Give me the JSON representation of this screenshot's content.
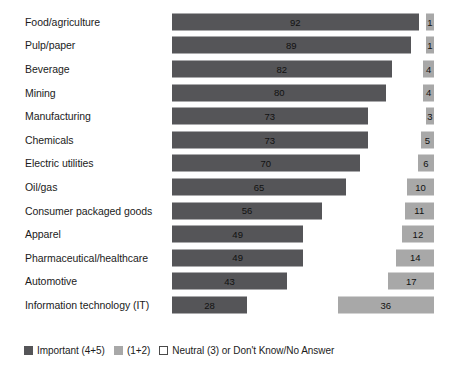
{
  "chart_data": {
    "type": "bar",
    "orientation": "horizontal",
    "stacked": true,
    "title": "",
    "subtitle": "",
    "xlabel": "",
    "ylabel": "",
    "xlim": [
      0,
      100
    ],
    "grid": false,
    "legend_position": "bottom-left",
    "categories": [
      "Food/agriculture",
      "Pulp/paper",
      "Beverage",
      "Mining",
      "Manufacturing",
      "Chemicals",
      "Electric utilities",
      "Oil/gas",
      "Consumer packaged goods",
      "Apparel",
      "Pharmaceutical/healthcare",
      "Automotive",
      "Information technology (IT)"
    ],
    "series": [
      {
        "name": "Important (4+5)",
        "color": "#555558",
        "values": [
          92,
          89,
          82,
          80,
          73,
          73,
          70,
          65,
          56,
          49,
          49,
          43,
          28
        ]
      },
      {
        "name": "(1+2)",
        "color": "#a8a8a8",
        "values": [
          1,
          1,
          4,
          4,
          3,
          5,
          6,
          10,
          11,
          12,
          14,
          17,
          36
        ]
      }
    ],
    "legend": [
      {
        "label": "Important (4+5)",
        "swatch": "dark-gray"
      },
      {
        "label": "(1+2)",
        "swatch": "light-gray"
      },
      {
        "label": "Neutral (3) or Don't Know/No Answer",
        "swatch": "white-outline"
      }
    ]
  },
  "rows": [
    {
      "label": "Food/agriculture",
      "important": 92,
      "low": 1
    },
    {
      "label": "Pulp/paper",
      "important": 89,
      "low": 1
    },
    {
      "label": "Beverage",
      "important": 82,
      "low": 4
    },
    {
      "label": "Mining",
      "important": 80,
      "low": 4
    },
    {
      "label": "Manufacturing",
      "important": 73,
      "low": 3
    },
    {
      "label": "Chemicals",
      "important": 73,
      "low": 5
    },
    {
      "label": "Electric utilities",
      "important": 70,
      "low": 6
    },
    {
      "label": "Oil/gas",
      "important": 65,
      "low": 10
    },
    {
      "label": "Consumer packaged goods",
      "important": 56,
      "low": 11
    },
    {
      "label": "Apparel",
      "important": 49,
      "low": 12
    },
    {
      "label": "Pharmaceutical/healthcare",
      "important": 49,
      "low": 14
    },
    {
      "label": "Automotive",
      "important": 43,
      "low": 17
    },
    {
      "label": "Information technology (IT)",
      "important": 28,
      "low": 36
    }
  ],
  "legend": {
    "important_label": "Important (4+5)",
    "low_label": "(1+2)",
    "neutral_label": "Neutral (3) or Don't Know/No Answer"
  },
  "colors": {
    "important": "#555558",
    "low": "#a8a8a8",
    "neutral": "#ffffff",
    "text": "#1b1b1b",
    "background": "#ffffff"
  }
}
